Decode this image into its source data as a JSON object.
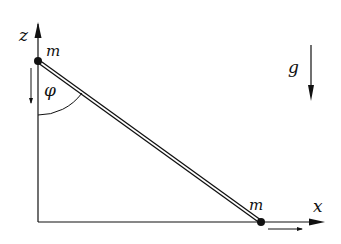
{
  "diagram": {
    "labels": {
      "z_axis": "z",
      "x_axis": "x",
      "mass_top": "m",
      "mass_bottom": "m",
      "angle": "φ",
      "gravity": "g"
    },
    "colors": {
      "line": "#111111",
      "background": "#ffffff"
    }
  }
}
